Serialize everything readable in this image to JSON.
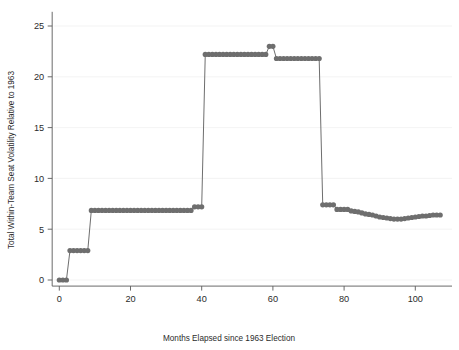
{
  "chart_data": {
    "type": "line",
    "title": "",
    "subtitle": "",
    "xlabel": "Months Elapsed since 1963 Election",
    "ylabel": "Total Within-Team Seat Volatility Relative to 1963",
    "xlim": [
      -2,
      109
    ],
    "ylim": [
      -0.6,
      26.2
    ],
    "xticks": [
      0,
      20,
      40,
      60,
      80,
      100
    ],
    "yticks": [
      0,
      5,
      10,
      15,
      20,
      25
    ],
    "xtick_labels": [
      "0",
      "20",
      "40",
      "60",
      "80",
      "100"
    ],
    "ytick_labels": [
      "0",
      "5",
      "10",
      "15",
      "20",
      "25"
    ],
    "grid": true,
    "grid_axis": "y",
    "legend": false,
    "legend_position": "none",
    "marker": "circle",
    "marker_size": 2.6,
    "series_color": "#6e6e6e",
    "grid_color": "#f0f0f0",
    "axis_color": "#5a5a5a",
    "background_color": "#ffffff",
    "series": [
      {
        "name": "Total Within-Team Seat Volatility",
        "x": [
          0,
          1,
          2,
          3,
          4,
          5,
          6,
          7,
          8,
          9,
          10,
          11,
          12,
          13,
          14,
          15,
          16,
          17,
          18,
          19,
          20,
          21,
          22,
          23,
          24,
          25,
          26,
          27,
          28,
          29,
          30,
          31,
          32,
          33,
          34,
          35,
          36,
          37,
          38,
          39,
          40,
          41,
          42,
          43,
          44,
          45,
          46,
          47,
          48,
          49,
          50,
          51,
          52,
          53,
          54,
          55,
          56,
          57,
          58,
          59,
          60,
          61,
          62,
          63,
          64,
          65,
          66,
          67,
          68,
          69,
          70,
          71,
          72,
          73,
          74,
          75,
          76,
          77,
          78,
          79,
          80,
          81,
          82,
          83,
          84,
          85,
          86,
          87,
          88,
          89,
          90,
          91,
          92,
          93,
          94,
          95,
          96,
          97,
          98,
          99,
          100,
          101,
          102,
          103,
          104,
          105,
          106,
          107
        ],
        "y": [
          0.0,
          0.0,
          0.0,
          2.9,
          2.9,
          2.9,
          2.9,
          2.9,
          2.9,
          6.85,
          6.85,
          6.85,
          6.85,
          6.85,
          6.85,
          6.85,
          6.85,
          6.85,
          6.85,
          6.85,
          6.85,
          6.85,
          6.85,
          6.85,
          6.85,
          6.85,
          6.85,
          6.85,
          6.85,
          6.85,
          6.85,
          6.85,
          6.85,
          6.85,
          6.85,
          6.85,
          6.85,
          6.85,
          7.2,
          7.2,
          7.2,
          22.2,
          22.2,
          22.2,
          22.2,
          22.2,
          22.2,
          22.2,
          22.2,
          22.2,
          22.2,
          22.2,
          22.2,
          22.2,
          22.2,
          22.2,
          22.2,
          22.2,
          22.2,
          23.0,
          23.0,
          21.8,
          21.8,
          21.8,
          21.8,
          21.8,
          21.8,
          21.8,
          21.8,
          21.8,
          21.8,
          21.8,
          21.8,
          21.8,
          7.4,
          7.4,
          7.4,
          7.4,
          6.95,
          6.95,
          6.95,
          6.95,
          6.8,
          6.75,
          6.7,
          6.6,
          6.5,
          6.45,
          6.4,
          6.3,
          6.2,
          6.15,
          6.1,
          6.05,
          6.0,
          6.0,
          6.0,
          6.05,
          6.1,
          6.15,
          6.2,
          6.25,
          6.3,
          6.3,
          6.35,
          6.4,
          6.4,
          6.4
        ]
      }
    ]
  }
}
